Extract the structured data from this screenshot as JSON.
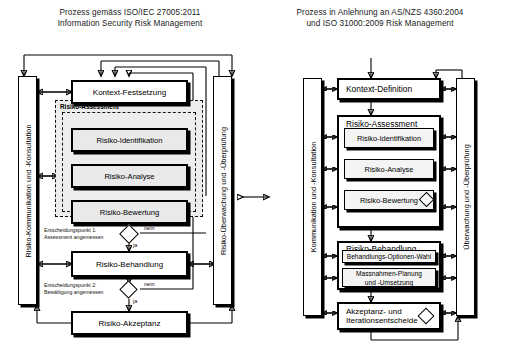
{
  "page": {
    "background": "#ffffff",
    "accent": "#000000"
  },
  "left_diagram": {
    "title": "Prozess gemäss ISO/IEC 27005:2011\nInformation Security Risk Management",
    "side_left_label": "Risiko-Kommunikation und -Konsultation",
    "side_right_label": "Risiko-Überwachung und -Überprüfung",
    "group": {
      "label": "Risiko-Assessment"
    },
    "boxes": {
      "context": "Kontext-Festsetzung",
      "identification": "Risiko-Identifikation",
      "analysis": "Risiko-Analyse",
      "evaluation": "Risiko-Bewertung",
      "treatment": "Risiko-Behandlung",
      "acceptance": "Risiko-Akzeptanz"
    },
    "decisions": [
      {
        "label": "Entscheidungspunkt 1:\nAssessment angemessen",
        "no": "nein",
        "yes": "ja"
      },
      {
        "label": "Entscheidungspunkt 2:\nBewältigung angemessen",
        "no": "nein",
        "yes": "ja"
      }
    ]
  },
  "right_diagram": {
    "title": "Prozess in Anlehnung an AS/NZS 4360:2004\nund ISO 31000:2009 Risk Management",
    "side_left_label": "Kommunikation und -Konsultation",
    "side_right_label": "Überwachung und -Überprüfung",
    "boxes": {
      "context": "Kontext-Definition",
      "assessment_group": "Risiko-Assessment",
      "identification": "Risiko-Identifikation",
      "analysis": "Risiko-Analyse",
      "evaluation": "Risiko-Bewertung",
      "treatment_group": "Risiko-Behandlung",
      "options": "Behandlungs-Optionen-Wahl",
      "measures": "Massnahmen-Planung\nund -Umsetzung",
      "acceptance": "Akzeptanz- und\nIterationsentscheide"
    }
  },
  "center": {
    "compare_icon": "double-arrow-icon"
  }
}
